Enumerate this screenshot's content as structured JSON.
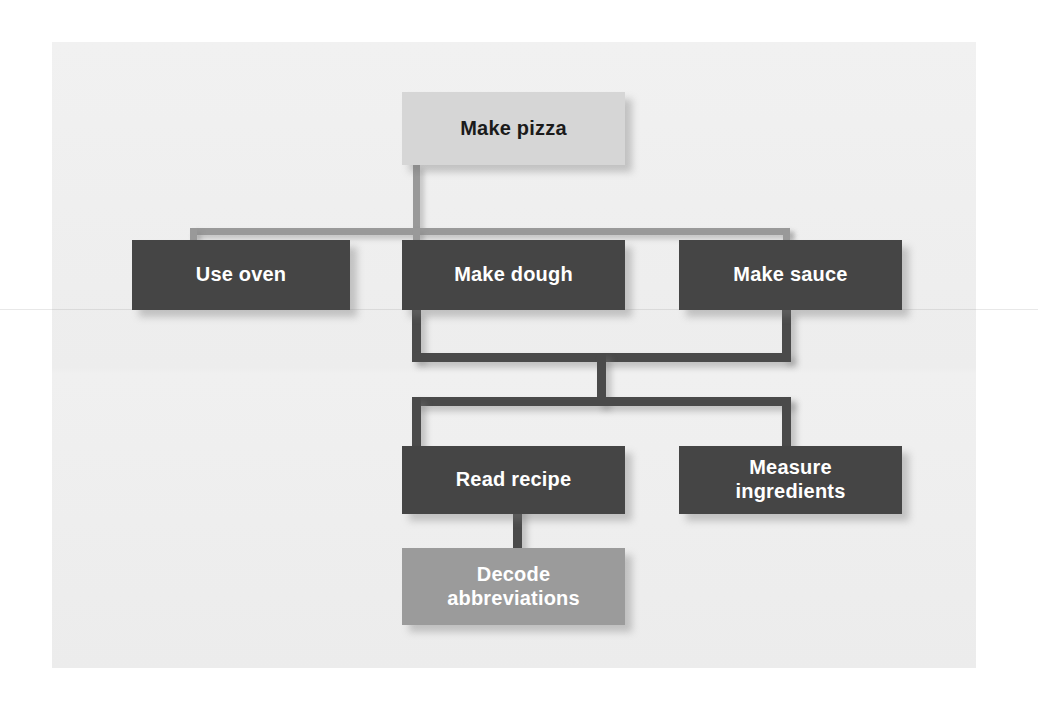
{
  "diagram": {
    "type": "hierarchy-tree",
    "canvas": {
      "background_color": "#efefef",
      "page_background_color": "#ffffff"
    },
    "palette": {
      "dark_node": "#454545",
      "mid_node": "#9b9b9b",
      "light_node": "#d6d6d6",
      "dark_node_text": "#ffffff",
      "light_node_text": "#1b1b1b",
      "connector_dark": "#4a4a4a",
      "connector_light": "#999999"
    },
    "nodes": [
      {
        "id": "make-pizza",
        "label": "Make pizza",
        "level": 0,
        "style": "light"
      },
      {
        "id": "use-oven",
        "label": "Use oven",
        "level": 1,
        "style": "dark"
      },
      {
        "id": "make-dough",
        "label": "Make dough",
        "level": 1,
        "style": "dark"
      },
      {
        "id": "make-sauce",
        "label": "Make sauce",
        "level": 1,
        "style": "dark"
      },
      {
        "id": "read-recipe",
        "label": "Read recipe",
        "level": 2,
        "style": "dark"
      },
      {
        "id": "measure-ingredients",
        "label": "Measure\ningredients",
        "level": 2,
        "style": "dark"
      },
      {
        "id": "decode-abbreviations",
        "label": "Decode\nabbreviations",
        "level": 3,
        "style": "mid"
      }
    ],
    "edges": [
      {
        "from": "make-pizza",
        "to": "use-oven"
      },
      {
        "from": "make-pizza",
        "to": "make-dough"
      },
      {
        "from": "make-pizza",
        "to": "make-sauce"
      },
      {
        "from": "make-dough",
        "to": "read-recipe"
      },
      {
        "from": "make-dough",
        "to": "measure-ingredients"
      },
      {
        "from": "make-sauce",
        "to": "read-recipe"
      },
      {
        "from": "make-sauce",
        "to": "measure-ingredients"
      },
      {
        "from": "read-recipe",
        "to": "decode-abbreviations"
      }
    ]
  }
}
